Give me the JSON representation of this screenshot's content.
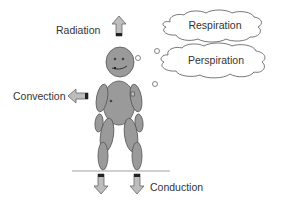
{
  "diagram": {
    "labels": {
      "radiation": "Radiation",
      "convection": "Convection",
      "conduction": "Conduction",
      "respiration": "Respiration",
      "perspiration": "Perspiration"
    },
    "colors": {
      "body_fill": "#9a9a9a",
      "body_stroke": "#555555",
      "arrow_fill": "#bdbdbd",
      "arrow_stroke": "#666666",
      "arrow_base": "#222222",
      "text": "#333333",
      "cloud_stroke": "#555555",
      "ground_line": "#888888"
    }
  }
}
